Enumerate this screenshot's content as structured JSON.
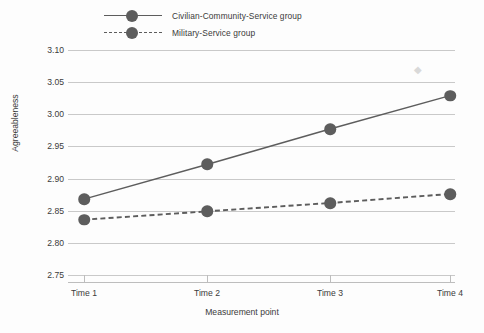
{
  "chart_data": {
    "type": "line",
    "title": "",
    "xlabel": "Measurement point",
    "ylabel": "Agreeableness",
    "categories": [
      "Time 1",
      "Time 2",
      "Time 3",
      "Time 4"
    ],
    "ylim": [
      2.75,
      3.1
    ],
    "yticks": [
      "2.75",
      "2.80",
      "2.85",
      "2.90",
      "2.95",
      "3.00",
      "3.05",
      "3.10"
    ],
    "ytick_values": [
      2.75,
      2.8,
      2.85,
      2.9,
      2.95,
      3.0,
      3.05,
      3.1
    ],
    "grid": "horizontal",
    "legend_position": "top-left",
    "series": [
      {
        "name": "Civilian-Community-Service group",
        "values": [
          2.868,
          2.922,
          2.977,
          3.029
        ],
        "line_style": "solid",
        "marker": "circle",
        "color": "#5d5d5d"
      },
      {
        "name": "Military-Service group",
        "values": [
          2.836,
          2.849,
          2.862,
          2.876
        ],
        "line_style": "dashed",
        "marker": "circle",
        "color": "#5d5d5d"
      }
    ],
    "annotations": [
      {
        "name": "faint-droplet-artifact",
        "glyph": "◆",
        "x_category": "between Time 3 and Time 4",
        "y_value": 3.068
      }
    ]
  },
  "colors": {
    "background": "#fdfdfd",
    "gridline": "#c9c9c9",
    "axis": "#bdbdbd",
    "series": "#5d5d5d",
    "text": "#3b3b3b"
  },
  "legend": {
    "items": [
      {
        "label": "Civilian-Community-Service group",
        "style": "solid"
      },
      {
        "label": "Military-Service group",
        "style": "dashed"
      }
    ]
  }
}
